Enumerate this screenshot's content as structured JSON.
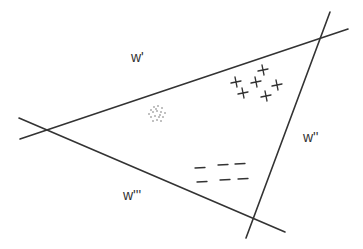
{
  "diagram": {
    "labels": [
      {
        "id": "w1",
        "text": "w'",
        "x": 131,
        "y": 62
      },
      {
        "id": "w2",
        "text": "w''",
        "x": 303,
        "y": 142
      },
      {
        "id": "w3",
        "text": "w'''",
        "x": 123,
        "y": 200
      }
    ],
    "lines": [
      {
        "id": "line-w1",
        "x1": 20,
        "y1": 139,
        "x2": 348,
        "y2": 29
      },
      {
        "id": "line-w2",
        "x1": 330,
        "y1": 12,
        "x2": 246,
        "y2": 238
      },
      {
        "id": "line-w3",
        "x1": 19,
        "y1": 118,
        "x2": 285,
        "y2": 232
      }
    ],
    "classes": [
      {
        "name": "plus",
        "symbol": "+",
        "points": [
          [
            263,
            70
          ],
          [
            236,
            82
          ],
          [
            256,
            82
          ],
          [
            277,
            85
          ],
          [
            243,
            93
          ],
          [
            266,
            96
          ]
        ]
      },
      {
        "name": "minus",
        "symbol": "-",
        "points": [
          [
            200,
            168
          ],
          [
            223,
            165
          ],
          [
            240,
            164
          ],
          [
            202,
            182
          ],
          [
            225,
            180
          ],
          [
            243,
            179
          ]
        ]
      },
      {
        "name": "dot-cluster",
        "symbol": ".",
        "center": [
          157,
          113
        ]
      }
    ],
    "colors": {
      "line": "#333333",
      "background": "#ffffff"
    }
  }
}
